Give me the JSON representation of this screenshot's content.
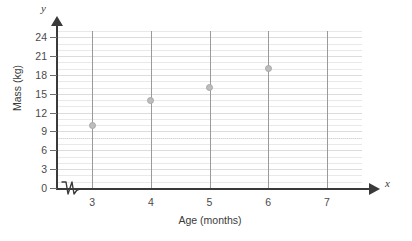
{
  "chart_data": {
    "type": "scatter",
    "title": "",
    "xlabel": "Age (months)",
    "ylabel": "Mass (kg)",
    "x_axis_letter": "x",
    "y_axis_letter": "y",
    "xlim": [
      2.4,
      7.6
    ],
    "ylim": [
      0,
      25
    ],
    "x_ticks": [
      3,
      4,
      5,
      6,
      7
    ],
    "x_tick_labels": [
      "3",
      "4",
      "5",
      "6",
      "7"
    ],
    "y_ticks": [
      0,
      3,
      6,
      9,
      12,
      15,
      18,
      21,
      24
    ],
    "y_tick_labels": [
      "0",
      "3",
      "6",
      "9",
      "12",
      "15",
      "18",
      "21",
      "24"
    ],
    "y_minor_step": 1,
    "grid": true,
    "grid_style": "horizontal-minor-and-vertical-at-x-ticks",
    "legend": "none",
    "axis_break": {
      "axis": "x",
      "symbol": "zigzag",
      "between": [
        0,
        3
      ]
    },
    "point_color": "#bdbdbd",
    "points": [
      {
        "x": 3,
        "y": 10
      },
      {
        "x": 4,
        "y": 14
      },
      {
        "x": 5,
        "y": 16
      },
      {
        "x": 6,
        "y": 19
      }
    ],
    "x": [
      3,
      4,
      5,
      6
    ],
    "values": [
      10,
      14,
      16,
      19
    ]
  }
}
